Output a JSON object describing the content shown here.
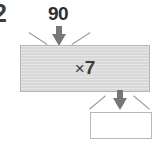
{
  "worksheet": {
    "question_number": "2",
    "machine": {
      "input_label": "90",
      "operation_sign": "×",
      "operation_operand": "7",
      "operation_full": "×7",
      "output_value": "",
      "output_placeholder": ""
    },
    "icons": {
      "input_arrow": "arrow-down-icon",
      "output_arrow": "arrow-down-icon"
    },
    "colors": {
      "machine_fill": "#d8d8d8",
      "machine_border": "#b4b4b4",
      "arrow": "#767676",
      "notch_line": "#9a9a9a",
      "answer_border": "#b8b8b8",
      "text": "#2e2e2e",
      "background": "#ffffff"
    }
  }
}
